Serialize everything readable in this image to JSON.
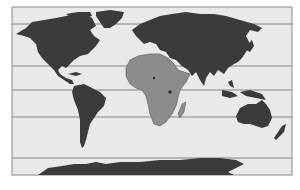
{
  "map": {
    "title": "World map with Africa highlighted",
    "projection": "equirectangular",
    "highlighted_region": "Africa",
    "colors": {
      "ocean": "#e9e9e9",
      "land": "#3b3b3b",
      "highlight": "#8c8c8c",
      "frame": "#8a8a8a",
      "gridline": "#6a6a6a"
    },
    "latitude_lines_y": [
      24,
      66,
      90,
      117,
      158
    ],
    "regions": [
      {
        "name": "North America",
        "highlighted": false
      },
      {
        "name": "Greenland",
        "highlighted": false
      },
      {
        "name": "South America",
        "highlighted": false
      },
      {
        "name": "Europe",
        "highlighted": false
      },
      {
        "name": "Asia",
        "highlighted": false
      },
      {
        "name": "Africa",
        "highlighted": true
      },
      {
        "name": "Madagascar",
        "highlighted": false
      },
      {
        "name": "Australia",
        "highlighted": false
      },
      {
        "name": "New Zealand",
        "highlighted": false
      },
      {
        "name": "Antarctica",
        "highlighted": false
      }
    ]
  }
}
